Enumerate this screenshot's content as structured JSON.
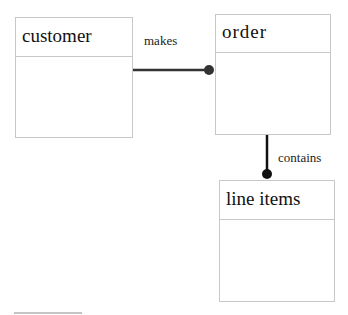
{
  "entities": [
    {
      "name": "customer"
    },
    {
      "name": "order"
    },
    {
      "name": "line items"
    }
  ],
  "relationships": [
    {
      "label": "makes",
      "from": "customer",
      "to": "order"
    },
    {
      "label": "contains",
      "from": "order",
      "to": "line items"
    }
  ],
  "colors": {
    "line": "#333333",
    "border": "#c8c8c8"
  }
}
